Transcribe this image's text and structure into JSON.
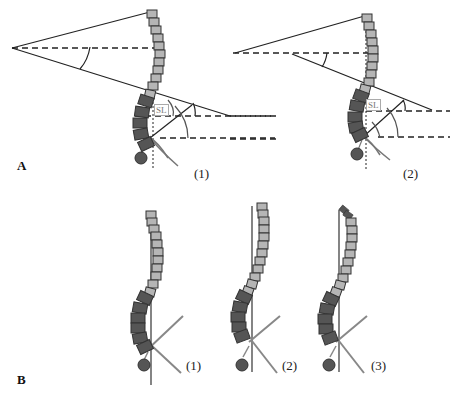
{
  "figure": {
    "panel_a": {
      "label": "A",
      "case_1": {
        "label": "(1)",
        "sl_label": "SL"
      },
      "case_2": {
        "label": "(2)",
        "sl_label": "SL"
      }
    },
    "panel_b": {
      "label": "B",
      "case_1": {
        "label": "(1)"
      },
      "case_2": {
        "label": "(2)"
      },
      "case_3": {
        "label": "(3)"
      }
    }
  },
  "colors": {
    "thoracic_vertebra": "#b5b5b5",
    "lumbar_vertebra": "#555555",
    "vertebra_outline": "#333333",
    "femoral_head": "#555555",
    "line": "#222222",
    "plumb_line_grey": "#888888"
  }
}
